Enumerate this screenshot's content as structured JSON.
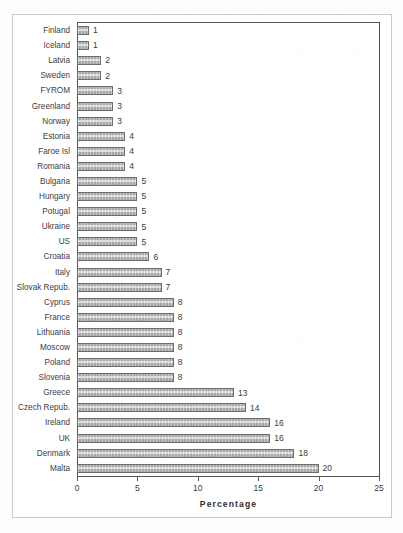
{
  "chart_data": {
    "type": "bar",
    "orientation": "horizontal",
    "title": "",
    "subtitle": "",
    "xlabel": "Percentage",
    "ylabel": "",
    "xlim": [
      0,
      25
    ],
    "xticks": [
      "0",
      "5",
      "10",
      "15",
      "20",
      "25"
    ],
    "grid": false,
    "legend": null,
    "bar_fill_color": "#a8a8a8",
    "bar_border_color": "#6d6d6d",
    "show_data_labels": true,
    "categories": [
      "Finland",
      "Iceland",
      "Latvia",
      "Sweden",
      "FYROM",
      "Greenland",
      "Norway",
      "Estonia",
      "Faroe Isl",
      "Romania",
      "Bulgaria",
      "Hungary",
      "Potugal",
      "Ukraine",
      "US",
      "Croatia",
      "Italy",
      "Slovak Repub.",
      "Cyprus",
      "France",
      "Lithuania",
      "Moscow",
      "Poland",
      "Slovenia",
      "Greece",
      "Czech Repub.",
      "Ireland",
      "UK",
      "Denmark",
      "Malta"
    ],
    "values": [
      1,
      1,
      2,
      2,
      3,
      3,
      3,
      4,
      4,
      4,
      5,
      5,
      5,
      5,
      5,
      6,
      7,
      7,
      8,
      8,
      8,
      8,
      8,
      8,
      13,
      14,
      16,
      16,
      18,
      20
    ],
    "data_labels": [
      "1",
      "1",
      "2",
      "2",
      "3",
      "3",
      "3",
      "4",
      "4",
      "4",
      "5",
      "5",
      "5",
      "5",
      "5",
      "6",
      "7",
      "7",
      "8",
      "8",
      "8",
      "8",
      "8",
      "8",
      "13",
      "14",
      "16",
      "16",
      "18",
      "20"
    ]
  }
}
